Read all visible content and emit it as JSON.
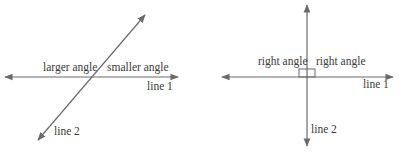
{
  "left_diagram": {
    "label_larger": "larger angle",
    "label_smaller": "smaller angle",
    "label_line1": "line 1",
    "label_line2": "line 2"
  },
  "right_diagram": {
    "label_right_left": "right angle",
    "label_right_right": "right angle",
    "label_line1": "line 1",
    "label_line2": "line 2"
  },
  "colors": {
    "line": "#6a6a6a",
    "text": "#3a3a3a",
    "background": "#ffffff"
  }
}
